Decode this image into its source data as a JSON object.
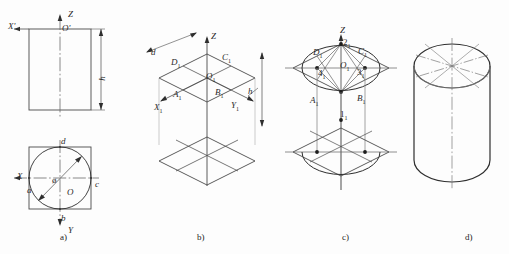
{
  "figure": {
    "background": "#fdfdfd",
    "line_color": "#4a4a4a",
    "heavy_line_color": "#2e2e2e",
    "center_line_color": "#6a6a6a",
    "text_color": "#2b2b2b",
    "width": 509,
    "height": 254
  },
  "panels": [
    {
      "id": "a",
      "caption": "a)",
      "caption_x": 60,
      "caption_y": 232,
      "description": "Orthographic views: front view rectangle with height h, top view square with inscribed circle of diameter d",
      "labels": [
        {
          "name": "axis-z-label",
          "text": "Z",
          "x": 68,
          "y": 10,
          "italic": true
        },
        {
          "name": "origin-o-prime-label",
          "text": "O'",
          "x": 62,
          "y": 24,
          "italic": true
        },
        {
          "name": "axis-x-prime-label",
          "text": "X'",
          "x": 8,
          "y": 22,
          "italic": true
        },
        {
          "name": "dimension-h-label",
          "text": "h",
          "x": 100,
          "y": 74,
          "italic": true,
          "rotated": true
        },
        {
          "name": "point-d-label",
          "text": "d",
          "x": 61,
          "y": 137,
          "italic": true
        },
        {
          "name": "point-a-label",
          "text": "a",
          "x": 27,
          "y": 186,
          "italic": true
        },
        {
          "name": "point-c-label",
          "text": "c",
          "x": 95,
          "y": 180,
          "italic": true
        },
        {
          "name": "point-b-label",
          "text": "b",
          "x": 61,
          "y": 214,
          "italic": true
        },
        {
          "name": "origin-o-label",
          "text": "O",
          "x": 67,
          "y": 188,
          "italic": true
        },
        {
          "name": "axis-x-label",
          "text": "X",
          "x": 17,
          "y": 172,
          "italic": true
        },
        {
          "name": "axis-y-label",
          "text": "Y",
          "x": 68,
          "y": 226,
          "italic": true
        },
        {
          "name": "diameter-symbol",
          "text": "ø",
          "x": 52,
          "y": 176,
          "italic": false
        }
      ]
    },
    {
      "id": "b",
      "caption": "b)",
      "caption_x": 197,
      "caption_y": 232,
      "description": "Isometric axes with upper and lower circumscribing rhombi of side d, separated by height h",
      "labels": [
        {
          "name": "axis-z-label",
          "text": "Z",
          "x": 211,
          "y": 32,
          "italic": true
        },
        {
          "name": "dimension-d-label",
          "text": "d",
          "x": 151,
          "y": 48,
          "italic": true
        },
        {
          "name": "point-d1-label",
          "text": "D",
          "sub": "1",
          "x": 171,
          "y": 58,
          "italic": true
        },
        {
          "name": "point-c1-label",
          "text": "C",
          "sub": "1",
          "x": 222,
          "y": 53,
          "italic": true
        },
        {
          "name": "point-o1-label",
          "text": "O",
          "sub": "1",
          "x": 206,
          "y": 72,
          "italic": true
        },
        {
          "name": "point-a1-label",
          "text": "A",
          "sub": "1",
          "x": 173,
          "y": 90,
          "italic": true
        },
        {
          "name": "point-b1-label",
          "text": "B",
          "sub": "1",
          "x": 215,
          "y": 88,
          "italic": true
        },
        {
          "name": "axis-x1-label",
          "text": "X",
          "sub": "1",
          "x": 154,
          "y": 103,
          "italic": true
        },
        {
          "name": "axis-y1-label",
          "text": "Y",
          "sub": "1",
          "x": 231,
          "y": 101,
          "italic": true
        },
        {
          "name": "dimension-h-label",
          "text": "h",
          "x": 248,
          "y": 87,
          "italic": true
        }
      ]
    },
    {
      "id": "c",
      "caption": "c)",
      "caption_x": 342,
      "caption_y": 232,
      "description": "Four-centre approximate ellipse construction: centres 1, 2, 3, 4 with connecting lines and arcs, projected to the lower rhombus",
      "labels": [
        {
          "name": "axis-z-label",
          "text": "Z",
          "x": 340,
          "y": 26,
          "italic": true
        },
        {
          "name": "point-2-1-label",
          "text": "2",
          "sub": "1",
          "x": 343,
          "y": 38,
          "italic": false
        },
        {
          "name": "point-d1-label",
          "text": "D",
          "sub": "1",
          "x": 313,
          "y": 48,
          "italic": true
        },
        {
          "name": "point-c1-label",
          "text": "C",
          "sub": "1",
          "x": 358,
          "y": 47,
          "italic": true
        },
        {
          "name": "point-o1-label",
          "text": "O",
          "sub": "1",
          "x": 340,
          "y": 61,
          "italic": true
        },
        {
          "name": "point-4-1-label",
          "text": "4",
          "sub": "1",
          "x": 318,
          "y": 69,
          "italic": false
        },
        {
          "name": "point-3-1-label",
          "text": "3",
          "sub": "1",
          "x": 357,
          "y": 68,
          "italic": false
        },
        {
          "name": "point-a1-label",
          "text": "A",
          "sub": "1",
          "x": 310,
          "y": 96,
          "italic": true
        },
        {
          "name": "point-b1-label",
          "text": "B",
          "sub": "1",
          "x": 357,
          "y": 94,
          "italic": true
        },
        {
          "name": "point-1-1-label",
          "text": "1",
          "sub": "1",
          "x": 340,
          "y": 110,
          "italic": false
        }
      ]
    },
    {
      "id": "d",
      "caption": "d)",
      "caption_x": 465,
      "caption_y": 232,
      "description": "Completed isometric cylinder with top ellipse, silhouette lines, bottom ellipse arc and centre lines",
      "labels": []
    }
  ]
}
